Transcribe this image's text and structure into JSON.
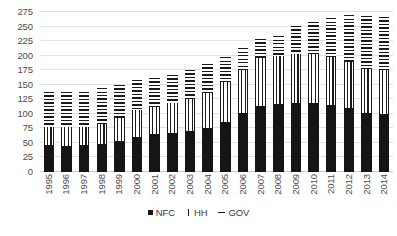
{
  "chart_data": {
    "type": "bar",
    "stacked": true,
    "title": "",
    "subtitle": "",
    "xlabel": "",
    "ylabel": "",
    "ylim": [
      0,
      275
    ],
    "ytick_step": 25,
    "yticks": [
      0,
      25,
      50,
      75,
      100,
      125,
      150,
      175,
      200,
      225,
      250,
      275
    ],
    "ytick_labels": [
      "0",
      "25",
      "50",
      "75",
      "100",
      "125",
      "150",
      "175",
      "200",
      "225",
      "250",
      "275"
    ],
    "grid": true,
    "grid_axis": "y",
    "legend_position": "bottom",
    "categories": [
      "1995",
      "1996",
      "1997",
      "1998",
      "1999",
      "2000",
      "2001",
      "2002",
      "2003",
      "2004",
      "2005",
      "2006",
      "2007",
      "2008",
      "2009",
      "2010",
      "2011",
      "2012",
      "2013",
      "2014"
    ],
    "series": [
      {
        "name": "NFC",
        "fill": "solid-black",
        "color": "#151515",
        "values": [
          46,
          44,
          46,
          49,
          54,
          60,
          65,
          67,
          71,
          76,
          86,
          101,
          113,
          117,
          119,
          119,
          116,
          110,
          102,
          100
        ]
      },
      {
        "name": "HH",
        "fill": "vertical-lines",
        "color": "#1a1a1a",
        "values": [
          32,
          34,
          32,
          33,
          39,
          46,
          46,
          51,
          55,
          60,
          68,
          75,
          83,
          82,
          83,
          83,
          81,
          79,
          75,
          75
        ]
      },
      {
        "name": "GOV",
        "fill": "horizontal-lines",
        "color": "#1a1a1a",
        "values": [
          60,
          59,
          59,
          63,
          57,
          53,
          50,
          49,
          50,
          50,
          44,
          37,
          32,
          35,
          49,
          56,
          68,
          81,
          91,
          91
        ]
      }
    ],
    "totals": [
      138,
      137,
      137,
      145,
      150,
      159,
      161,
      167,
      176,
      186,
      198,
      213,
      228,
      234,
      251,
      258,
      265,
      270,
      268,
      266
    ]
  },
  "legend": {
    "items": [
      {
        "label": "NFC",
        "swatch": "solid-square-icon"
      },
      {
        "label": "HH",
        "swatch": "vertical-bar-icon"
      },
      {
        "label": "GOV",
        "swatch": "horizontal-dash-icon"
      }
    ]
  }
}
